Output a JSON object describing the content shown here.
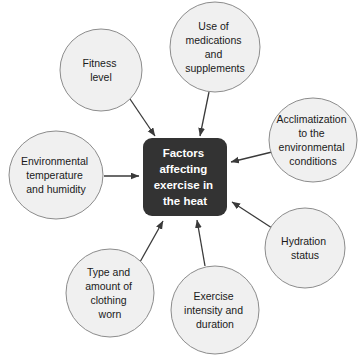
{
  "diagram": {
    "type": "concept-map",
    "center": {
      "label": "Factors affecting exercise in the heat",
      "lines": [
        "Factors",
        "affecting",
        "exercise in",
        "the heat"
      ],
      "fill_color": "#333333",
      "text_color": "#ffffff"
    },
    "style": {
      "node_fill": "#f0f0f0",
      "node_stroke": "#8c8c8c",
      "arrow_color": "#3a3a3a",
      "background": "#ffffff"
    },
    "nodes": [
      {
        "id": "fitness-level",
        "label": "Fitness level",
        "lines": [
          "Fitness",
          "level"
        ],
        "cx": 101,
        "cy": 70,
        "rx": 41,
        "ry": 41
      },
      {
        "id": "medications-supplements",
        "label": "Use of medications and supplements",
        "lines": [
          "Use of",
          "medications",
          "and",
          "supplements"
        ],
        "cx": 215,
        "cy": 47,
        "rx": 45,
        "ry": 45
      },
      {
        "id": "acclimatization",
        "label": "Acclimatization to the environmental conditions",
        "lines": [
          "Acclimatization",
          "to the",
          "environmental",
          "conditions"
        ],
        "cx": 313,
        "cy": 140,
        "rx": 44,
        "ry": 42
      },
      {
        "id": "hydration-status",
        "label": "Hydration status",
        "lines": [
          "Hydration",
          "status"
        ],
        "cx": 305,
        "cy": 248,
        "rx": 40,
        "ry": 40
      },
      {
        "id": "exercise-intensity-duration",
        "label": "Exercise intensity and duration",
        "lines": [
          "Exercise",
          "intensity and",
          "duration"
        ],
        "cx": 215,
        "cy": 310,
        "rx": 44,
        "ry": 44
      },
      {
        "id": "clothing",
        "label": "Type and amount of clothing worn",
        "lines": [
          "Type and",
          "amount of",
          "clothing",
          "worn"
        ],
        "cx": 110,
        "cy": 293,
        "rx": 44,
        "ry": 44
      },
      {
        "id": "environmental-temp-humidity",
        "label": "Environmental temperature and humidity",
        "lines": [
          "Environmental",
          "temperature",
          "and humidity"
        ],
        "cx": 56,
        "cy": 175,
        "rx": 47,
        "ry": 44
      }
    ],
    "connections": [
      {
        "from": "fitness-level",
        "to": "center"
      },
      {
        "from": "medications-supplements",
        "to": "center"
      },
      {
        "from": "acclimatization",
        "to": "center"
      },
      {
        "from": "hydration-status",
        "to": "center"
      },
      {
        "from": "exercise-intensity-duration",
        "to": "center"
      },
      {
        "from": "clothing",
        "to": "center"
      },
      {
        "from": "environmental-temp-humidity",
        "to": "center"
      }
    ]
  }
}
